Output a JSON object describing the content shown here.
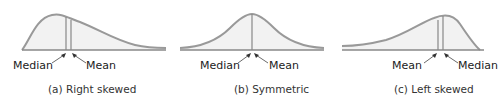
{
  "panels": [
    {
      "shape": "right-skewed",
      "left_label": "Median",
      "right_label": "Mean",
      "caption": "(a)  Right skewed"
    },
    {
      "shape": "symmetric",
      "left_label": "Median",
      "right_label": "Mean",
      "caption": "(b) Symmetric"
    },
    {
      "shape": "left-skewed",
      "left_label": "Mean",
      "right_label": "Median",
      "caption": "(c)  Left skewed"
    }
  ],
  "colors": {
    "curve": "#999999",
    "fill": "#f2f2f2",
    "axis": "#888888",
    "lines": "#888888",
    "text": "#222222"
  }
}
